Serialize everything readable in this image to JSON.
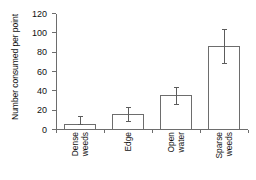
{
  "chart_data": {
    "type": "bar",
    "title": "",
    "xlabel": "",
    "ylabel": "Number consumed per point",
    "categories": [
      "Dense weeds",
      "Edge",
      "Open water",
      "Sparse weeds"
    ],
    "category_lines": [
      [
        "Dense",
        "weeds"
      ],
      [
        "Edge"
      ],
      [
        "Open",
        "water"
      ],
      [
        "Sparse",
        "weeds"
      ]
    ],
    "values": [
      5,
      16,
      35,
      86
    ],
    "errors_upper": [
      15,
      24,
      45,
      104
    ],
    "errors_lower": [
      5,
      8,
      26,
      68
    ],
    "ylim": [
      0,
      120
    ],
    "yticks": [
      0,
      20,
      40,
      60,
      80,
      100,
      120
    ],
    "ytick_labels": [
      "0",
      "20",
      "40",
      "60",
      "80",
      "100",
      "120"
    ],
    "grid": false,
    "legend": false,
    "bar_facecolor": "#ffffff",
    "bar_edgecolor": "#6d6d6d",
    "error_color": "#5c5c5c",
    "axis_color": "#6d6d6d",
    "background": "#ffffff"
  }
}
